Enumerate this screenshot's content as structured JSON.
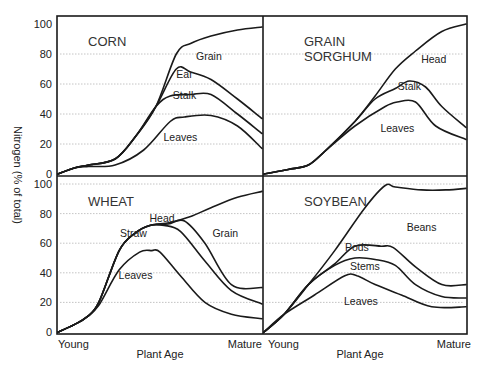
{
  "chart_data": {
    "type": "area",
    "title": "",
    "ylabel": "Nitrogen (% of total)",
    "xlabel": "Plant Age",
    "x_tick_labels": [
      "Young",
      "Mature"
    ],
    "y_ticks": [
      0,
      20,
      40,
      60,
      80,
      100
    ],
    "ylim": [
      0,
      100
    ],
    "xlim": [
      0,
      100
    ],
    "grid": "horizontal dotted",
    "layout": "2x2 panels",
    "panels": [
      {
        "name": "CORN",
        "title_lines": [
          "CORN"
        ],
        "position": "top-left",
        "series": [
          {
            "name": "Leaves",
            "x": [
              0,
              8,
              15,
              28,
              42,
              55,
              62,
              75,
              88,
              100
            ],
            "values": [
              0,
              4,
              5,
              6,
              16,
              35,
              38,
              39,
              32,
              17
            ]
          },
          {
            "name": "Stalk",
            "x": [
              0,
              8,
              15,
              28,
              38,
              48,
              55,
              65,
              75,
              88,
              100
            ],
            "values": [
              0,
              4,
              6,
              10,
              25,
              45,
              52,
              53,
              53,
              40,
              27
            ]
          },
          {
            "name": "Ear",
            "x": [
              0,
              8,
              15,
              28,
              38,
              48,
              58,
              65,
              75,
              88,
              100
            ],
            "values": [
              0,
              4,
              6,
              10,
              25,
              45,
              70,
              68,
              63,
              50,
              37
            ]
          },
          {
            "name": "Grain",
            "x": [
              0,
              8,
              15,
              28,
              38,
              48,
              58,
              65,
              75,
              88,
              100
            ],
            "values": [
              0,
              4,
              6,
              10,
              25,
              45,
              80,
              87,
              92,
              96,
              98
            ]
          }
        ],
        "labels": [
          {
            "text": "Grain",
            "x": 74,
            "y": 76
          },
          {
            "text": "Ear",
            "x": 62,
            "y": 64
          },
          {
            "text": "Stalk",
            "x": 62,
            "y": 50
          },
          {
            "text": "Leaves",
            "x": 60,
            "y": 22
          }
        ]
      },
      {
        "name": "GRAIN SORGHUM",
        "title_lines": [
          "GRAIN",
          "SORGHUM"
        ],
        "position": "top-right",
        "series": [
          {
            "name": "Leaves",
            "x": [
              0,
              12,
              22,
              30,
              45,
              60,
              66,
              75,
              85,
              100
            ],
            "values": [
              0,
              3,
              6,
              15,
              32,
              45,
              48,
              48,
              32,
              23
            ]
          },
          {
            "name": "Stalk",
            "x": [
              0,
              12,
              22,
              30,
              45,
              55,
              65,
              72,
              80,
              88,
              100
            ],
            "values": [
              0,
              3,
              6,
              15,
              35,
              50,
              57,
              62,
              58,
              45,
              31
            ]
          },
          {
            "name": "Head",
            "x": [
              0,
              12,
              22,
              30,
              45,
              55,
              65,
              75,
              88,
              100
            ],
            "values": [
              0,
              3,
              6,
              15,
              35,
              52,
              70,
              82,
              95,
              100
            ]
          }
        ],
        "labels": [
          {
            "text": "Head",
            "x": 84,
            "y": 74
          },
          {
            "text": "Stalk",
            "x": 72,
            "y": 56
          },
          {
            "text": "Leaves",
            "x": 66,
            "y": 28
          }
        ]
      },
      {
        "name": "WHEAT",
        "title_lines": [
          "WHEAT"
        ],
        "position": "bottom-left",
        "series": [
          {
            "name": "Leaves",
            "x": [
              0,
              8,
              14,
              20,
              30,
              40,
              46,
              50,
              60,
              72,
              85,
              100
            ],
            "values": [
              0,
              5,
              10,
              18,
              42,
              54,
              55,
              54,
              38,
              20,
              12,
              9
            ]
          },
          {
            "name": "Straw",
            "x": [
              0,
              8,
              14,
              20,
              30,
              38,
              45,
              52,
              60,
              72,
              85,
              100
            ],
            "values": [
              0,
              5,
              10,
              20,
              55,
              67,
              72,
              72,
              68,
              48,
              28,
              19
            ]
          },
          {
            "name": "Head",
            "x": [
              0,
              8,
              14,
              20,
              30,
              38,
              45,
              54,
              62,
              72,
              85,
              100
            ],
            "values": [
              0,
              5,
              10,
              20,
              55,
              67,
              72,
              73,
              75,
              60,
              32,
              30
            ]
          },
          {
            "name": "Grain",
            "x": [
              0,
              8,
              14,
              20,
              30,
              38,
              45,
              55,
              65,
              75,
              88,
              100
            ],
            "values": [
              0,
              5,
              10,
              20,
              55,
              67,
              72,
              74,
              78,
              84,
              91,
              95
            ]
          }
        ],
        "labels": [
          {
            "text": "Straw",
            "x": 37,
            "y": 64
          },
          {
            "text": "Head",
            "x": 51,
            "y": 74
          },
          {
            "text": "Grain",
            "x": 82,
            "y": 64
          },
          {
            "text": "Leaves",
            "x": 38,
            "y": 36
          }
        ]
      },
      {
        "name": "SOYBEAN",
        "title_lines": [
          "SOYBEAN"
        ],
        "position": "bottom-right",
        "series": [
          {
            "name": "Leaves",
            "x": [
              0,
              10,
              25,
              40,
              46,
              55,
              68,
              83,
              100
            ],
            "values": [
              0,
              12,
              25,
              38,
              38,
              32,
              25,
              17,
              17
            ]
          },
          {
            "name": "Stems",
            "x": [
              0,
              10,
              22,
              35,
              45,
              55,
              65,
              75,
              88,
              100
            ],
            "values": [
              0,
              12,
              32,
              45,
              50,
              49,
              45,
              32,
              24,
              23
            ]
          },
          {
            "name": "Pods",
            "x": [
              0,
              10,
              22,
              35,
              45,
              58,
              64,
              75,
              88,
              100
            ],
            "values": [
              0,
              12,
              32,
              46,
              58,
              58,
              57,
              44,
              32,
              32
            ]
          },
          {
            "name": "Beans",
            "x": [
              0,
              10,
              22,
              35,
              50,
              60,
              65,
              78,
              90,
              100
            ],
            "values": [
              0,
              12,
              32,
              55,
              84,
              99,
              98,
              96,
              96,
              97
            ]
          }
        ],
        "labels": [
          {
            "text": "Beans",
            "x": 78,
            "y": 68
          },
          {
            "text": "Pods",
            "x": 46,
            "y": 55
          },
          {
            "text": "Stems",
            "x": 50,
            "y": 42
          },
          {
            "text": "Leaves",
            "x": 48,
            "y": 18
          }
        ]
      }
    ]
  },
  "axes": {
    "y_label": "Nitrogen (% of total)",
    "x_label_left": "Plant Age",
    "x_label_right": "Plant Age",
    "young_label": "Young",
    "mature_label": "Mature"
  },
  "colors": {
    "line": "#1a1a1a",
    "grid": "#b5b5b5",
    "background": "#ffffff"
  }
}
